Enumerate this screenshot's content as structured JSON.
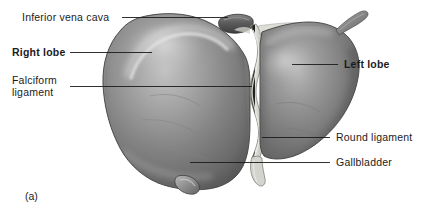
{
  "figure": {
    "panel_letter": "(a)",
    "background_color": "#ffffff",
    "text_color": "#1b1b1b",
    "leader_line_color": "#1b1b1b"
  },
  "labels": {
    "inferior_vena_cava": {
      "text": "Inferior vena cava",
      "bold": false,
      "side": "left"
    },
    "right_lobe": {
      "text": "Right lobe",
      "bold": true,
      "side": "left"
    },
    "falciform_ligament_line1": {
      "text": "Falciform",
      "bold": false,
      "side": "left"
    },
    "falciform_ligament_line2": {
      "text": "ligament",
      "bold": false,
      "side": "left"
    },
    "left_lobe": {
      "text": "Left lobe",
      "bold": true,
      "side": "right"
    },
    "round_ligament": {
      "text": "Round ligament",
      "bold": false,
      "side": "right"
    },
    "gallbladder": {
      "text": "Gallbladder",
      "bold": false,
      "side": "right"
    }
  },
  "anatomy_parts": [
    "inferior-vena-cava",
    "right-lobe",
    "falciform-ligament",
    "left-lobe",
    "round-ligament",
    "gallbladder"
  ],
  "colors": {
    "liver_dark": "#6f6f6f",
    "liver_mid": "#878787",
    "liver_light": "#b4b4b4",
    "liver_highlight": "#cfcfcf",
    "liver_shadow": "#4e4e4e",
    "ligament_pale": "#d8d8d4",
    "outline": "#3a3a3a"
  }
}
